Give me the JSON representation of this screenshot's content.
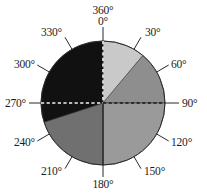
{
  "figure": {
    "title": "",
    "type": "pie-compass-diagram"
  },
  "chart_data": {
    "type": "pie",
    "title": "",
    "subtitle": "",
    "xlabel": "",
    "ylabel": "",
    "units": "degrees",
    "grid": false,
    "legend": "none",
    "center": {
      "x": 103,
      "y": 103
    },
    "radius": 62,
    "angle_convention": "clockwise from top (0 degrees at top / north)",
    "axis_ticks_deg": [
      0,
      30,
      60,
      90,
      120,
      150,
      180,
      210,
      240,
      270,
      300,
      330,
      360
    ],
    "tick_labels": [
      "0°",
      "30°",
      "60°",
      "90°",
      "120°",
      "150°",
      "180°",
      "210°",
      "240°",
      "270°",
      "300°",
      "330°",
      "360°"
    ],
    "categories": [
      "0–40°",
      "40–90°",
      "90–180°",
      "180–252°",
      "252–360°"
    ],
    "values": [
      40,
      50,
      90,
      72,
      108
    ],
    "slices": [
      {
        "label": "0–40°",
        "start_deg": 0,
        "end_deg": 40,
        "span_deg": 40,
        "color": "#c9c9c9"
      },
      {
        "label": "40–90°",
        "start_deg": 40,
        "end_deg": 90,
        "span_deg": 50,
        "color": "#8e8e8e"
      },
      {
        "label": "90–180°",
        "start_deg": 90,
        "end_deg": 180,
        "span_deg": 90,
        "color": "#9a9a9a"
      },
      {
        "label": "180–252°",
        "start_deg": 180,
        "end_deg": 252,
        "span_deg": 72,
        "color": "#707070"
      },
      {
        "label": "252–360°",
        "start_deg": 252,
        "end_deg": 360,
        "span_deg": 108,
        "color": "#111111"
      }
    ],
    "guide_lines": [
      {
        "name": "vertical-0-180-axis",
        "style": "dashed-above-center-solid-below",
        "deg": 0
      },
      {
        "name": "horizontal-90-270-axis",
        "style": "dashed",
        "deg": 90
      }
    ]
  },
  "labels": {
    "top_outer": "360°",
    "top_inner": "0°",
    "d30": "30°",
    "d60": "60°",
    "d90": "90°",
    "d120": "120°",
    "d150": "150°",
    "d180": "180°",
    "d210": "210°",
    "d240": "240°",
    "d270": "270°",
    "d300": "300°",
    "d330": "330°"
  },
  "colors": {
    "background": "#ffffff",
    "text": "#1c1c1c",
    "slice_light": "#c9c9c9",
    "slice_mid_dark": "#8e8e8e",
    "slice_mid": "#9a9a9a",
    "slice_dark": "#707070",
    "slice_black": "#111111",
    "outline": "#2b2b2b"
  }
}
